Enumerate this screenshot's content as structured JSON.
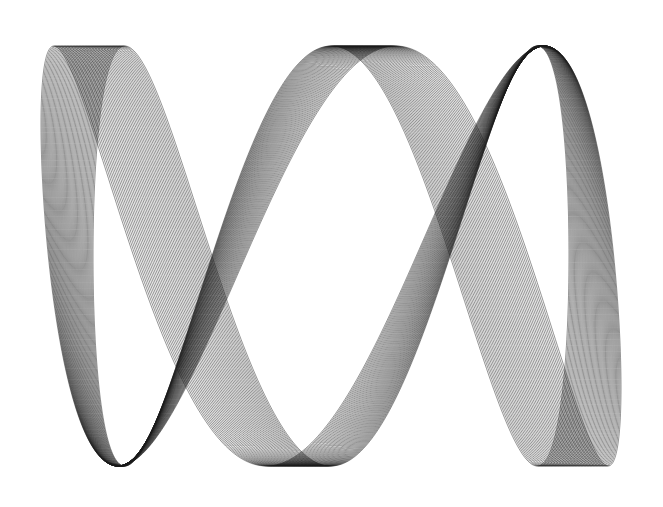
{
  "canvas": {
    "width": 663,
    "height": 507,
    "background": "#ffffff"
  },
  "artwork": {
    "description": "Generative line-art: family of overlapping Lissajous-like curves forming a ribbon",
    "stroke_color": "#1a1a1a",
    "curve_count": 48,
    "center_x": 331,
    "center_y": 256,
    "amplitude_x_start": 238,
    "amplitude_x_end": 290,
    "amplitude_y": 210,
    "freq_x": 1,
    "freq_y": 3,
    "phase_shift_start": 0.0,
    "phase_shift_end": 0.45
  }
}
